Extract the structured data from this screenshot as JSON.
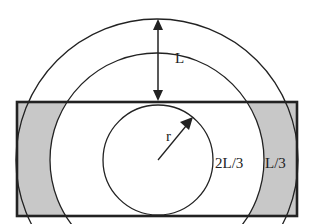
{
  "diagram": {
    "labels": {
      "length": "L",
      "radius": "r",
      "inner_band": "2L/3",
      "outer_band": "L/3"
    },
    "colors": {
      "stroke": "#222222",
      "shaded": "#c8c8c8",
      "background": "#ffffff"
    }
  }
}
